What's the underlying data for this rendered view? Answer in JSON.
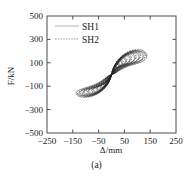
{
  "figure": {
    "caption": "(a)"
  },
  "chart_data": {
    "type": "line",
    "title": "",
    "subtitle": "",
    "xlabel": "Δ/mm",
    "ylabel": "F/kN",
    "xlim": [
      -250,
      250
    ],
    "ylim": [
      -500,
      500
    ],
    "xticks": [
      -250,
      -150,
      -50,
      50,
      150,
      250
    ],
    "xtick_labels": [
      "−250",
      "−150",
      "−50",
      "50",
      "150",
      "250"
    ],
    "yticks": [
      -500,
      -300,
      -100,
      100,
      300,
      500
    ],
    "ytick_labels": [
      "−500",
      "−300",
      "−100",
      "100",
      "300",
      "500"
    ],
    "grid": false,
    "legend_position": "upper-left-inside",
    "annotation": "Hysteresis loops: force-displacement cyclic response",
    "series": [
      {
        "name": "SH1",
        "style": "solid",
        "color": "#555555",
        "peak_positive_force": 180,
        "peak_negative_force": -205,
        "peak_positive_disp": 138,
        "peak_negative_disp": -150,
        "cycles": [
          {
            "amplitude": 18,
            "force_peak": 62,
            "pinch": 0.3
          },
          {
            "amplitude": 28,
            "force_peak": 88,
            "pinch": 0.32
          },
          {
            "amplitude": 40,
            "force_peak": 112,
            "pinch": 0.34
          },
          {
            "amplitude": 55,
            "force_peak": 132,
            "pinch": 0.36
          },
          {
            "amplitude": 72,
            "force_peak": 150,
            "pinch": 0.38
          },
          {
            "amplitude": 90,
            "force_peak": 163,
            "pinch": 0.4
          },
          {
            "amplitude": 108,
            "force_peak": 172,
            "pinch": 0.42
          },
          {
            "amplitude": 124,
            "force_peak": 178,
            "pinch": 0.44
          },
          {
            "amplitude": 138,
            "force_peak": 180,
            "pinch": 0.46
          }
        ]
      },
      {
        "name": "SH2",
        "style": "dashed",
        "color": "#222222",
        "peak_positive_force": 188,
        "peak_negative_force": -212,
        "peak_positive_disp": 132,
        "peak_negative_disp": -146,
        "cycles": [
          {
            "amplitude": 20,
            "force_peak": 68,
            "pinch": 0.29
          },
          {
            "amplitude": 32,
            "force_peak": 95,
            "pinch": 0.31
          },
          {
            "amplitude": 45,
            "force_peak": 120,
            "pinch": 0.33
          },
          {
            "amplitude": 60,
            "force_peak": 140,
            "pinch": 0.35
          },
          {
            "amplitude": 78,
            "force_peak": 158,
            "pinch": 0.37
          },
          {
            "amplitude": 96,
            "force_peak": 172,
            "pinch": 0.39
          },
          {
            "amplitude": 114,
            "force_peak": 182,
            "pinch": 0.41
          },
          {
            "amplitude": 132,
            "force_peak": 188,
            "pinch": 0.43
          }
        ]
      }
    ],
    "legend": [
      {
        "label": "SH1",
        "style": "solid"
      },
      {
        "label": "SH2",
        "style": "dashed"
      }
    ]
  }
}
